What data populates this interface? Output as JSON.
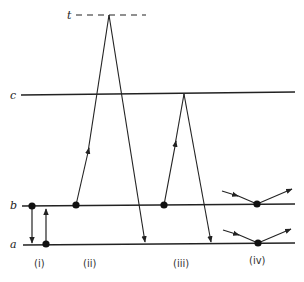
{
  "diagram": {
    "title": "",
    "levels": [
      {
        "id": "t",
        "label": "t",
        "style": "dashed"
      },
      {
        "id": "c",
        "label": "c",
        "style": "solid"
      },
      {
        "id": "b",
        "label": "b",
        "style": "solid"
      },
      {
        "id": "a",
        "label": "a",
        "style": "solid"
      }
    ],
    "processes": [
      {
        "id": "i",
        "label": "(i)",
        "description": "transition between b and a (down arrow from b, up arrow from a)"
      },
      {
        "id": "ii",
        "label": "(ii)",
        "description": "excitation from b to virtual level t, then decay to a"
      },
      {
        "id": "iii",
        "label": "(iii)",
        "description": "excitation from b to c, then decay to a"
      },
      {
        "id": "iv",
        "label": "(iv)",
        "description": "scattering at levels b and a (incoming and outgoing arrows)"
      }
    ],
    "colors": {
      "ink": "#222222",
      "background": "#ffffff"
    }
  }
}
